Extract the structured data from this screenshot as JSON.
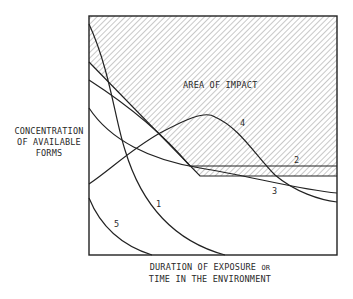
{
  "diagram": {
    "area_label": "AREA OF IMPACT",
    "y_axis": {
      "line1": "CONCENTRATION",
      "line2": "OF AVAILABLE",
      "line3": "FORMS"
    },
    "x_axis": {
      "line1_main": "DURATION OF EXPOSURE",
      "line1_small": "OR",
      "line2": "TIME IN THE ENVIRONMENT"
    },
    "curves": [
      {
        "id": "1",
        "label": "1",
        "description": "rapid decline from top-left to bottom"
      },
      {
        "id": "2",
        "label": "2",
        "description": "declines then levels off inside area of impact"
      },
      {
        "id": "3",
        "label": "3",
        "description": "gradual decline below area of impact"
      },
      {
        "id": "4",
        "label": "4",
        "description": "rises to a peak then declines"
      },
      {
        "id": "5",
        "label": "5",
        "description": "starts low and decays to zero"
      }
    ],
    "colors": {
      "line": "#222222",
      "hatch": "#9a9a9a",
      "background": "#ffffff"
    }
  }
}
